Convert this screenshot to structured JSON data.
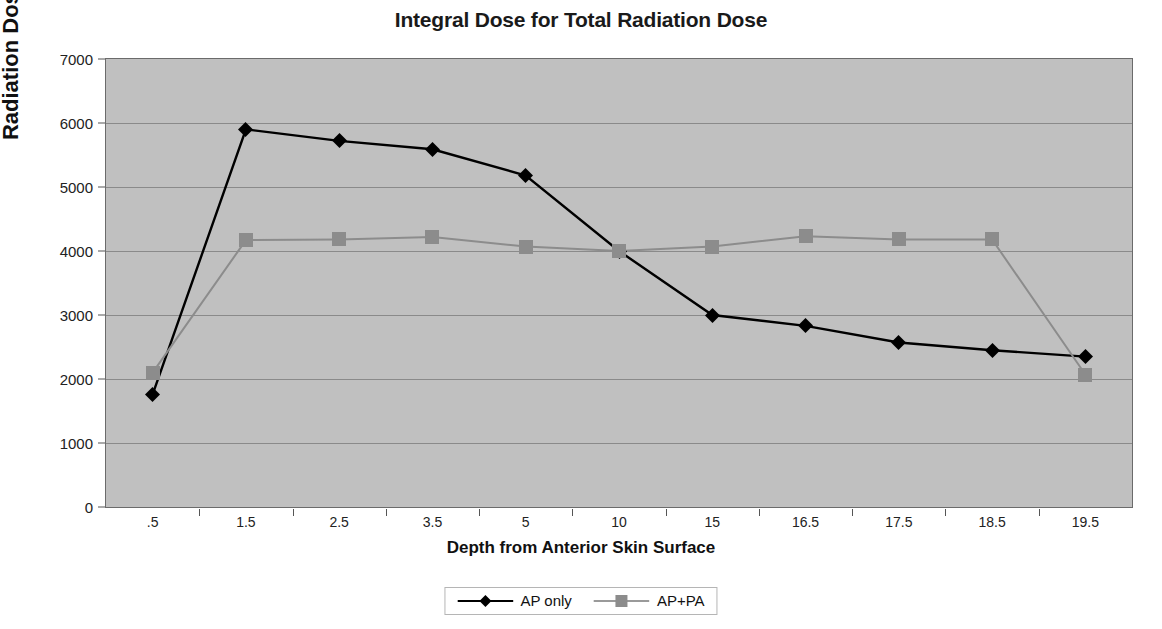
{
  "chart_data": {
    "type": "line",
    "title": "Integral Dose for Total Radiation Dose",
    "xlabel": "Depth from Anterior Skin Surface",
    "ylabel": "Radiation Dose",
    "categories": [
      ".5",
      "1.5",
      "2.5",
      "3.5",
      "5",
      "10",
      "15",
      "16.5",
      "17.5",
      "18.5",
      "19.5"
    ],
    "ylim": [
      0,
      7000
    ],
    "yticks": [
      0,
      1000,
      2000,
      3000,
      4000,
      5000,
      6000,
      7000
    ],
    "ytick_labels": [
      "0",
      "1000",
      "2000",
      "3000",
      "4000",
      "5000",
      "6000",
      "7000"
    ],
    "grid": true,
    "legend_position": "bottom",
    "plot_background": "#c0c0c0",
    "series": [
      {
        "name": "AP only",
        "color": "#000000",
        "marker": "diamond",
        "values": [
          1760,
          5900,
          5720,
          5590,
          5180,
          4000,
          3000,
          2830,
          2570,
          2450,
          2350
        ]
      },
      {
        "name": "AP+PA",
        "color": "#8c8c8c",
        "marker": "square",
        "values": [
          2100,
          4170,
          4180,
          4220,
          4070,
          4000,
          4070,
          4230,
          4180,
          4180,
          2070
        ]
      }
    ]
  },
  "legend": {
    "items": [
      {
        "label": "AP only"
      },
      {
        "label": "AP+PA"
      }
    ]
  }
}
